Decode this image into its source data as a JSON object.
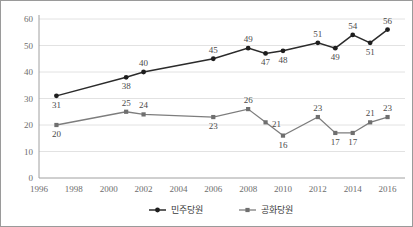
{
  "chart_data": {
    "type": "line",
    "title": "",
    "xlabel": "",
    "ylabel": "",
    "xlim": [
      1996,
      2017
    ],
    "ylim": [
      0,
      60
    ],
    "ytick_labels": [
      "0",
      "10",
      "20",
      "30",
      "40",
      "50",
      "60"
    ],
    "yticks": [
      0,
      10,
      20,
      30,
      40,
      50,
      60
    ],
    "xtick_labels": [
      "1996",
      "1998",
      "2000",
      "2002",
      "2004",
      "2006",
      "2008",
      "2010",
      "2012",
      "2014",
      "2016"
    ],
    "xticks": [
      1996,
      1998,
      2000,
      2002,
      2004,
      2006,
      2008,
      2010,
      2012,
      2014,
      2016
    ],
    "grid": true,
    "legend_position": "bottom",
    "x": [
      1997,
      2001,
      2002,
      2006,
      2008,
      2009,
      2010,
      2012,
      2013,
      2014,
      2015,
      2016
    ],
    "series": [
      {
        "name": "민주당원",
        "color": "#2b2b2b",
        "marker": "circle",
        "values": [
          31,
          38,
          40,
          45,
          49,
          47,
          48,
          51,
          49,
          54,
          51,
          56
        ],
        "label_positions": [
          "below",
          "below",
          "above",
          "above",
          "above",
          "below",
          "below",
          "above",
          "below",
          "above",
          "below",
          "above"
        ]
      },
      {
        "name": "공화당원",
        "color": "#7d7d7d",
        "marker": "square",
        "values": [
          20,
          25,
          24,
          23,
          26,
          21,
          16,
          23,
          17,
          17,
          21,
          23
        ],
        "label_positions": [
          "below",
          "above",
          "above",
          "below",
          "above",
          "right",
          "below",
          "above",
          "below",
          "below",
          "above",
          "above"
        ]
      }
    ]
  },
  "legend": {
    "items": [
      {
        "label": "민주당원"
      },
      {
        "label": "공화당원"
      }
    ]
  }
}
